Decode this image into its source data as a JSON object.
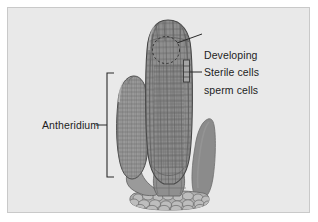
{
  "figure": {
    "background_color": "#ffffff",
    "panel_color": "#e9e9e9",
    "panel_border_color": "#c9c9c9",
    "ink_color": "#1d1d1d"
  },
  "labels": {
    "developing_sperm_cells": "Developing\nsperm cells",
    "developing_sperm_cells_line1": "Developing",
    "developing_sperm_cells_line2": "sperm cells",
    "sterile_cells": "Sterile cells",
    "antheridium": "Antheridium"
  },
  "structures": [
    {
      "name": "left-antheridium",
      "label": "Antheridium",
      "description": "club-shaped multicellular antheridium with fine cell mesh",
      "fill": "#9a9a9a",
      "textured": true
    },
    {
      "name": "central-antheridium",
      "label": "Antheridium",
      "description": "large central antheridium showing developing sperm cells and sterile jacket cells",
      "fill": "#8f8f8f",
      "textured": true
    },
    {
      "name": "right-antheridium",
      "label": "Antheridium",
      "description": "smooth unsectioned antheridium lobe",
      "fill": "#8b8b8b",
      "textured": false
    },
    {
      "name": "basal-cell-mass",
      "label": "",
      "description": "rounded cobblestone basal cells of the gametophyte receptacle",
      "fill": "#b0b0b0",
      "textured": false
    }
  ],
  "callouts": [
    {
      "name": "developing-sperm-cells",
      "target": "dotted circle inside central antheridium apex"
    },
    {
      "name": "sterile-cells",
      "target": "narrow jacket bracket on right wall of central antheridium"
    },
    {
      "name": "antheridium",
      "target": "vertical bracket spanning the left antheridium"
    }
  ],
  "colors": {
    "cell_stroke": "#5e5e5e",
    "outline": "#4a4a4a",
    "leader": "#2a2a2a",
    "bracket": "#2a2a2a"
  }
}
